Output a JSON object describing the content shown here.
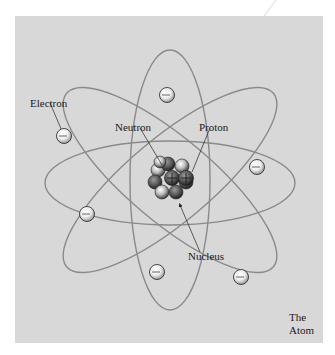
{
  "diagram": {
    "title_line1": "The",
    "title_line2": "Atom",
    "labels": {
      "electron": "Electron",
      "neutron": "Neutron",
      "proton": "Proton",
      "nucleus": "Nucleus"
    },
    "colors": {
      "background": "#d8d8d8",
      "orbit": "#8a8a8a",
      "text": "#1a1a1a"
    },
    "electron_count": 6,
    "orbit_count": 4
  }
}
